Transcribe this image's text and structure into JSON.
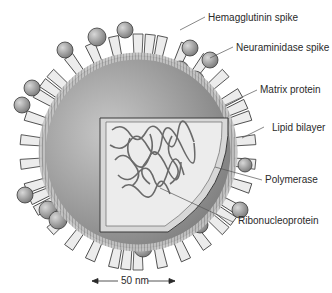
{
  "diagram": {
    "labels": {
      "hemagglutinin": "Hemagglutinin spike",
      "neuraminidase": "Neuraminidase spike",
      "matrix": "Matrix protein",
      "lipid": "Lipid bilayer",
      "polymerase": "Polymerase",
      "rnp": "Ribonucleoprotein"
    },
    "scale_bar": {
      "text": "50 nm"
    },
    "colors": {
      "background": "#ffffff",
      "outline": "#3a3a3a",
      "spike_fill": "#e8e8e8",
      "sphere_fill": "#9a9a9a",
      "interior_dark": "#8a8a8a",
      "interior_light": "#d6d6d6",
      "text": "#2a2a2a"
    }
  }
}
